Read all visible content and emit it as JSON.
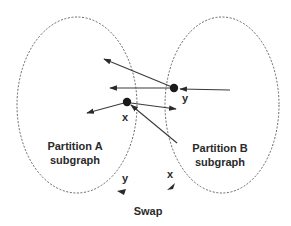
{
  "diagram": {
    "partitions": [
      {
        "id": "A",
        "label_line1": "Partition A",
        "label_line2": "subgraph"
      },
      {
        "id": "B",
        "label_line1": "Partition B",
        "label_line2": "subgraph"
      }
    ],
    "nodes": [
      {
        "id": "x",
        "label": "x"
      },
      {
        "id": "y",
        "label": "y"
      }
    ],
    "swap": {
      "label": "Swap",
      "left_label": "y",
      "right_label": "x"
    },
    "colors": {
      "line": "#3a3a3a",
      "node": "#1a1a1a",
      "text": "#2a2a2a",
      "boundary": "#555555"
    }
  }
}
